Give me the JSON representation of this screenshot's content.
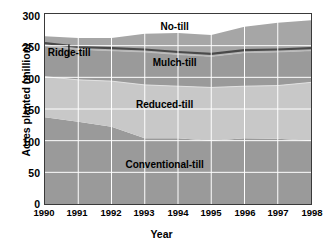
{
  "chart_data": {
    "type": "area",
    "stacked": true,
    "title": "",
    "xlabel": "Year",
    "ylabel": "Acres planted (million)",
    "x": [
      1990,
      1991,
      1992,
      1993,
      1994,
      1995,
      1996,
      1997,
      1998
    ],
    "xtick_labels": [
      "1990",
      "1991",
      "1992",
      "1993",
      "1994",
      "1995",
      "1996",
      "1997",
      "1998"
    ],
    "ytick_labels": [
      "0",
      "50",
      "100",
      "150",
      "200",
      "250",
      "300"
    ],
    "yticks": [
      0,
      50,
      100,
      150,
      200,
      250,
      300
    ],
    "ylim": [
      0,
      300
    ],
    "xlim": [
      1990,
      1998
    ],
    "grid": true,
    "legend": "in-plot labels",
    "series": [
      {
        "name": "Conventional-till",
        "color": "#9a9a9a",
        "values": [
          137,
          130,
          122,
          104,
          104,
          100,
          104,
          103,
          100
        ]
      },
      {
        "name": "Reduced-till",
        "color": "#c8c8c8",
        "values": [
          64,
          66,
          72,
          84,
          82,
          84,
          82,
          84,
          92
        ]
      },
      {
        "name": "Mulch-till",
        "color": "#9a9a9a",
        "values": [
          49,
          48,
          48,
          52,
          50,
          49,
          53,
          53,
          50
        ]
      },
      {
        "name": "Ridge-till",
        "color": "#b4b4b4",
        "values": [
          4,
          4,
          4,
          4,
          4,
          4,
          4,
          4,
          4
        ]
      },
      {
        "name": "No-till",
        "color": "#a6a6a6",
        "values": [
          11,
          14,
          16,
          25,
          30,
          30,
          37,
          42,
          44
        ]
      }
    ],
    "stack_tops": {
      "conventional_till": [
        137,
        130,
        122,
        104,
        104,
        100,
        104,
        103,
        100
      ],
      "reduced_till": [
        201,
        196,
        194,
        188,
        186,
        184,
        186,
        187,
        192
      ],
      "mulch_till": [
        250,
        244,
        242,
        240,
        236,
        233,
        239,
        240,
        242
      ],
      "ridge_till": [
        254,
        248,
        246,
        244,
        240,
        237,
        243,
        244,
        246
      ],
      "no_till": [
        265,
        262,
        262,
        269,
        270,
        267,
        280,
        286,
        290
      ]
    },
    "annotations": [
      {
        "text": "No-till",
        "x": 1993.9,
        "y": 278
      },
      {
        "text": "Mulch-till",
        "x": 1993.9,
        "y": 222
      },
      {
        "text": "Reduced-till",
        "x": 1993.6,
        "y": 157
      },
      {
        "text": "Conventional-till",
        "x": 1993.6,
        "y": 62
      },
      {
        "text": "Ridge-till",
        "x": 1990.75,
        "y": 238,
        "leader": true
      }
    ],
    "colors": {
      "axis": "#3a3a3a",
      "grid": "#ffffff",
      "boundary_dark": "#4a4a4a",
      "background": "#ffffff",
      "text": "#000000"
    }
  },
  "axes": {
    "y_title": "Acres planted (million)",
    "x_title": "Year",
    "y_ticks": [
      "300",
      "250",
      "200",
      "150",
      "100",
      "50",
      "0"
    ],
    "x_ticks": [
      "1990",
      "1991",
      "1992",
      "1993",
      "1994",
      "1995",
      "1996",
      "1997",
      "1998"
    ]
  },
  "series_labels": {
    "no_till": "No-till",
    "mulch_till": "Mulch-till",
    "reduced_till": "Reduced-till",
    "conventional_till": "Conventional-till",
    "ridge_till": "Ridge-till"
  }
}
